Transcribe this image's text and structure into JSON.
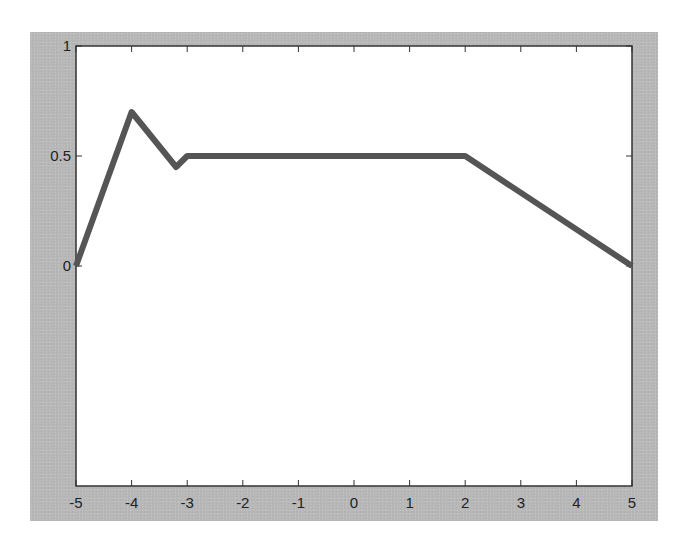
{
  "chart_data": {
    "type": "line",
    "title": "",
    "xlabel": "",
    "ylabel": "",
    "xlim": [
      -5,
      5
    ],
    "ylim": [
      -1,
      1
    ],
    "grid": false,
    "legend": null,
    "x_ticks": [
      -5,
      -4,
      -3,
      -2,
      -1,
      0,
      1,
      2,
      3,
      4,
      5
    ],
    "x_tick_labels": [
      "-5",
      "-4",
      "-3",
      "-2",
      "-1",
      "0",
      "1",
      "2",
      "3",
      "4",
      "5"
    ],
    "y_ticks": [
      0,
      0.5,
      1
    ],
    "y_tick_labels": [
      "0",
      "0.5",
      "1"
    ],
    "series": [
      {
        "name": "",
        "x": [
          -5,
          -4,
          -3.2,
          -3,
          2,
          5
        ],
        "y": [
          0,
          0.7,
          0.45,
          0.5,
          0.5,
          0
        ],
        "color": "#555555",
        "line_width": 6
      }
    ]
  },
  "colors": {
    "frame": "#b8b8b8",
    "plot_bg": "#ffffff",
    "axis": "#333333",
    "line": "#555555",
    "tick_text": "#222222"
  }
}
